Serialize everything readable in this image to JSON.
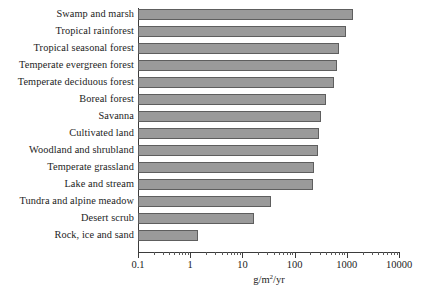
{
  "chart_data": {
    "type": "bar",
    "orientation": "horizontal",
    "title": "",
    "xlabel": "g/m2/yr",
    "xlabel_display": "g/m²/yr",
    "ylabel": "",
    "xscale": "log",
    "xlim": [
      0.1,
      10000
    ],
    "grid": false,
    "legend": null,
    "xticks": [
      0.1,
      1,
      10,
      100,
      1000,
      10000
    ],
    "xticklabels": [
      "0.1",
      "1",
      "10",
      "100",
      "1000",
      "10000"
    ],
    "categories": [
      "Swamp and marsh",
      "Tropical rainforest",
      "Tropical seasonal forest",
      "Temperate evergreen forest",
      "Temperate deciduous forest",
      "Boreal forest",
      "Savanna",
      "Cultivated land",
      "Woodland and shrubland",
      "Temperate grassland",
      "Lake and stream",
      "Tundra and alpine meadow",
      "Desert scrub",
      "Rock, ice and sand"
    ],
    "values": [
      1300,
      950,
      700,
      640,
      560,
      400,
      320,
      290,
      280,
      240,
      225,
      35,
      17,
      1.4
    ],
    "bar_color": "#9a9a9a",
    "bar_edge_color": "#5e5e5e",
    "axis_color": "#3b3b3b"
  }
}
